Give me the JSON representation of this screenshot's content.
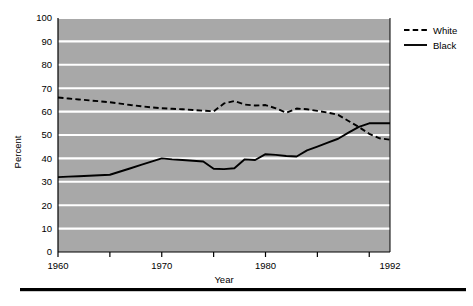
{
  "chart_data": {
    "type": "line",
    "title": "",
    "xlabel": "Year",
    "ylabel": "Percent",
    "xlim": [
      1960,
      1992
    ],
    "ylim": [
      0,
      100
    ],
    "grid": "horizontal",
    "legend_position": "top-right-outside",
    "plot_background": "#a8a8a8",
    "gridline_color": "#ffffff",
    "y_ticks": [
      0,
      10,
      20,
      30,
      40,
      50,
      60,
      70,
      80,
      90,
      100
    ],
    "y_tick_labels": [
      "0",
      "10",
      "20",
      "30",
      "40",
      "50",
      "60",
      "70",
      "80",
      "90",
      "100"
    ],
    "x_ticks": [
      1960,
      1965,
      1970,
      1975,
      1980,
      1985,
      1990
    ],
    "x_tick_labels_shown": [
      "1960",
      "1970",
      "1980",
      "1992"
    ],
    "x_label_values": [
      1960,
      1970,
      1980,
      1992
    ],
    "x": [
      1960,
      1961,
      1962,
      1963,
      1964,
      1965,
      1966,
      1967,
      1968,
      1969,
      1970,
      1971,
      1972,
      1973,
      1974,
      1975,
      1976,
      1977,
      1978,
      1979,
      1980,
      1981,
      1982,
      1983,
      1984,
      1985,
      1986,
      1987,
      1988,
      1989,
      1990,
      1991,
      1992
    ],
    "series": [
      {
        "name": "White",
        "style": "dashed",
        "color": "#000000",
        "values": [
          66,
          65.6,
          65.2,
          64.8,
          64.4,
          64,
          63.4,
          62.8,
          62.3,
          61.8,
          61.4,
          61.2,
          61,
          60.7,
          60.4,
          60.1,
          63.5,
          64.5,
          63,
          62.6,
          62.8,
          61.4,
          59.5,
          61.3,
          61,
          60.3,
          59.6,
          58.6,
          56,
          53.4,
          50.5,
          48.6,
          48
        ]
      },
      {
        "name": "Black",
        "style": "solid",
        "color": "#000000",
        "values": [
          32,
          32.2,
          32.4,
          32.6,
          32.8,
          33,
          34.4,
          35.8,
          37.2,
          38.6,
          40,
          39.6,
          39.3,
          39,
          38.7,
          35.6,
          35.4,
          35.8,
          39.6,
          39.3,
          41.8,
          41.5,
          41,
          40.8,
          43.4,
          45,
          46.7,
          48.4,
          51,
          53.5,
          55,
          55,
          55
        ]
      }
    ]
  },
  "legend": {
    "items": [
      {
        "label": "White",
        "style": "dashed"
      },
      {
        "label": "Black",
        "style": "solid"
      }
    ]
  },
  "axis": {
    "y_title": "Percent",
    "x_title": "Year"
  },
  "footer": {
    "caption": ""
  }
}
